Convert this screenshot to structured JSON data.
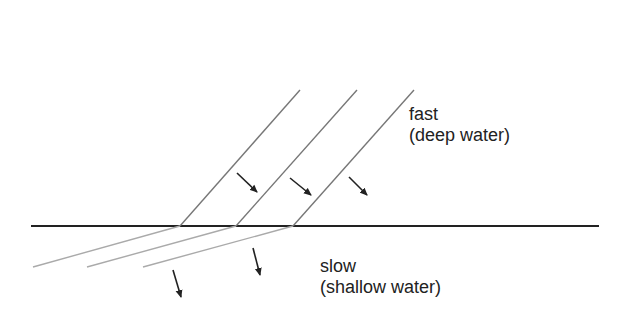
{
  "diagram": {
    "labels": {
      "upper": {
        "line1": "fast",
        "line2": "(deep water)"
      },
      "lower": {
        "line1": "slow",
        "line2": "(shallow water)"
      }
    },
    "colors": {
      "boundary": "#222222",
      "incident_wavefront": "#777777",
      "refracted_wavefront": "#aaaaaa",
      "arrow": "#222222",
      "text": "#222222"
    }
  }
}
